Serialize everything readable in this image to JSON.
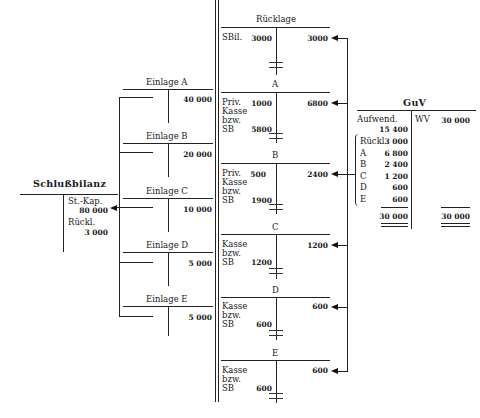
{
  "diagram": {
    "schlussbilanz": {
      "title": "Schlußbilanz",
      "stkap_label": "St.-Kap.",
      "stkap_value": "80 000",
      "rueckl_label": "Rückl.",
      "rueckl_value": "3 000"
    },
    "einlagen": [
      {
        "title": "Einlage A",
        "value": "40 000"
      },
      {
        "title": "Einlage B",
        "value": "20 000"
      },
      {
        "title": "Einlage C",
        "value": "10 000"
      },
      {
        "title": "Einlage D",
        "value": "5 000"
      },
      {
        "title": "Einlage E",
        "value": "5 000"
      }
    ],
    "konten": [
      {
        "title": "Rücklage",
        "left_label": "SBil.",
        "left_value": "3000",
        "sb_value": "",
        "right_value": "3000"
      },
      {
        "title": "A",
        "left_label": "Priv.\nKasse\nbzw.\nSB",
        "left_value": "1000",
        "sb_value": "5800",
        "right_value": "6800"
      },
      {
        "title": "B",
        "left_label": "Priv.\nKasse\nbzw.\nSB",
        "left_value": "500",
        "sb_value": "1900",
        "right_value": "2400"
      },
      {
        "title": "C",
        "left_label": "Kasse\nbzw.\nSB",
        "left_value": "",
        "sb_value": "1200",
        "right_value": "1200"
      },
      {
        "title": "D",
        "left_label": "Kasse\nbzw.\nSB",
        "left_value": "",
        "sb_value": "600",
        "right_value": "600"
      },
      {
        "title": "E",
        "left_label": "Kasse\nbzw.\nSB",
        "left_value": "",
        "sb_value": "600",
        "right_value": "600"
      }
    ],
    "guv": {
      "title": "GuV",
      "aufwend_label": "Aufwend.",
      "aufwend_value": "15 400",
      "wv_label": "WV",
      "wv_value": "30 000",
      "items": [
        {
          "label": "Rückl.",
          "value": "3 000"
        },
        {
          "label": "A",
          "value": "6 800"
        },
        {
          "label": "B",
          "value": "2 400"
        },
        {
          "label": "C",
          "value": "1 200"
        },
        {
          "label": "D",
          "value": "600"
        },
        {
          "label": "E",
          "value": "600"
        }
      ],
      "total_left": "30 000",
      "total_right": "30 000"
    }
  }
}
